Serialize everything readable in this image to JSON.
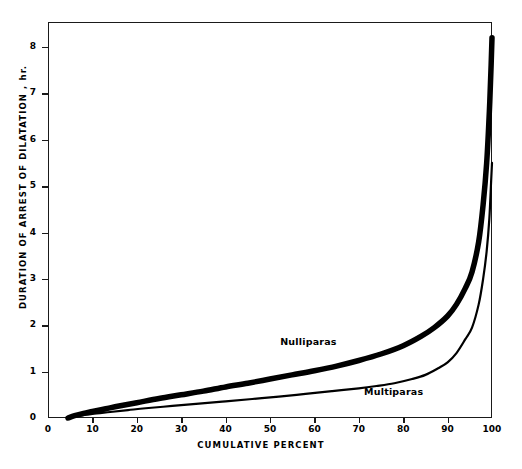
{
  "chart_data": {
    "type": "line",
    "title": "",
    "subtitle": "",
    "xlabel": "CUMULATIVE PERCENT",
    "ylabel": "DURATION OF ARREST OF DILATATION , hr.",
    "xlim": [
      0,
      100
    ],
    "ylim": [
      0,
      8.5
    ],
    "xticks": [
      0,
      10,
      20,
      30,
      40,
      50,
      60,
      70,
      80,
      90,
      100
    ],
    "xtick_labels": [
      "0",
      "10",
      "20",
      "30",
      "40",
      "50",
      "60",
      "70",
      "80",
      "90",
      "100"
    ],
    "yticks": [
      0,
      1,
      2,
      3,
      4,
      5,
      6,
      7,
      8
    ],
    "ytick_labels": [
      "0",
      "1",
      "2",
      "3",
      "4",
      "5",
      "6",
      "7",
      "8"
    ],
    "grid": false,
    "legend_position": "inline-annotation",
    "series": [
      {
        "name": "Nulliparas",
        "style": "thick",
        "linewidth_px": 5.5,
        "color": "#000000",
        "x": [
          4.5,
          6,
          8,
          10,
          13,
          16,
          20,
          25,
          30,
          35,
          40,
          45,
          50,
          55,
          60,
          65,
          70,
          75,
          80,
          84,
          87,
          90,
          92,
          94,
          95.5,
          97,
          98,
          98.8,
          99.4,
          99.8,
          100
        ],
        "values": [
          0.0,
          0.05,
          0.1,
          0.14,
          0.2,
          0.26,
          0.33,
          0.42,
          0.5,
          0.58,
          0.67,
          0.75,
          0.84,
          0.93,
          1.02,
          1.12,
          1.24,
          1.38,
          1.56,
          1.76,
          1.95,
          2.2,
          2.45,
          2.8,
          3.15,
          3.8,
          4.6,
          5.5,
          6.6,
          7.6,
          8.2
        ]
      },
      {
        "name": "Multiparas",
        "style": "thin",
        "linewidth_px": 2.2,
        "color": "#000000",
        "x": [
          4.5,
          6,
          8,
          10,
          14,
          18,
          22,
          28,
          34,
          40,
          46,
          52,
          58,
          64,
          70,
          74,
          78,
          82,
          85,
          88,
          90,
          92,
          94,
          95.5,
          97,
          98,
          98.8,
          99.4,
          99.8,
          100
        ],
        "values": [
          0.0,
          0.03,
          0.06,
          0.09,
          0.13,
          0.17,
          0.21,
          0.26,
          0.31,
          0.36,
          0.41,
          0.46,
          0.52,
          0.58,
          0.64,
          0.69,
          0.75,
          0.84,
          0.93,
          1.08,
          1.2,
          1.4,
          1.7,
          1.95,
          2.45,
          3.0,
          3.6,
          4.3,
          5.1,
          5.5
        ]
      }
    ],
    "annotations": [
      {
        "text": "Nulliparas",
        "x_pct": 64,
        "y_hr": 1.63
      },
      {
        "text": "Multiparas",
        "x_pct": 82,
        "y_hr": 0.55
      }
    ]
  },
  "axes": {
    "y_title": "DURATION OF ARREST OF DILATATION , hr.",
    "x_title": "CUMULATIVE PERCENT"
  },
  "labels": {
    "nulliparas": "Nulliparas",
    "multiparas": "Multiparas"
  }
}
